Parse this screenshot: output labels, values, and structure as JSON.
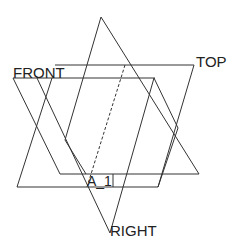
{
  "diagram": {
    "title": "",
    "labels": {
      "front": "FRONT",
      "top": "TOP",
      "right": "RIGHT",
      "a1": "A_1"
    },
    "line_color": "#333333",
    "background": "#ffffff",
    "planes": [
      {
        "name": "FRONT",
        "shape": "parallelogram"
      },
      {
        "name": "TOP",
        "shape": "parallelogram"
      },
      {
        "name": "RIGHT",
        "shape": "triangle"
      }
    ],
    "axis": {
      "name": "A_1",
      "style": "dashed"
    }
  }
}
